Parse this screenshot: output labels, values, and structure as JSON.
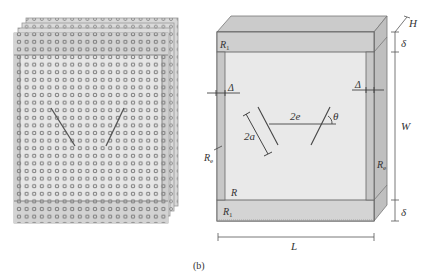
{
  "figure": {
    "caption": "(b)",
    "left_panel": {
      "description": "stacked perforated plates with two inclined cracks",
      "plate_count": 4
    },
    "right_panel": {
      "labels": {
        "H": "H",
        "delta_top": "δ",
        "delta_bottom": "δ",
        "W": "W",
        "L": "L",
        "R1_top": "R",
        "R1_top_sub": "1",
        "R1_bottom": "R",
        "R1_bottom_sub": "1",
        "Re_left": "R",
        "Re_left_sub": "e",
        "Re_right": "R",
        "Re_right_sub": "e",
        "R": "R",
        "Delta_left": "Δ",
        "Delta_right": "Δ",
        "two_a": "2a",
        "two_e": "2e",
        "theta": "θ"
      }
    }
  },
  "colors": {
    "face": "#e9e9e9",
    "band": "#cfcfcf",
    "side": "#bdbdbd",
    "top": "#c9c9c9",
    "line": "#555555",
    "hole": "#7a7a7a"
  }
}
